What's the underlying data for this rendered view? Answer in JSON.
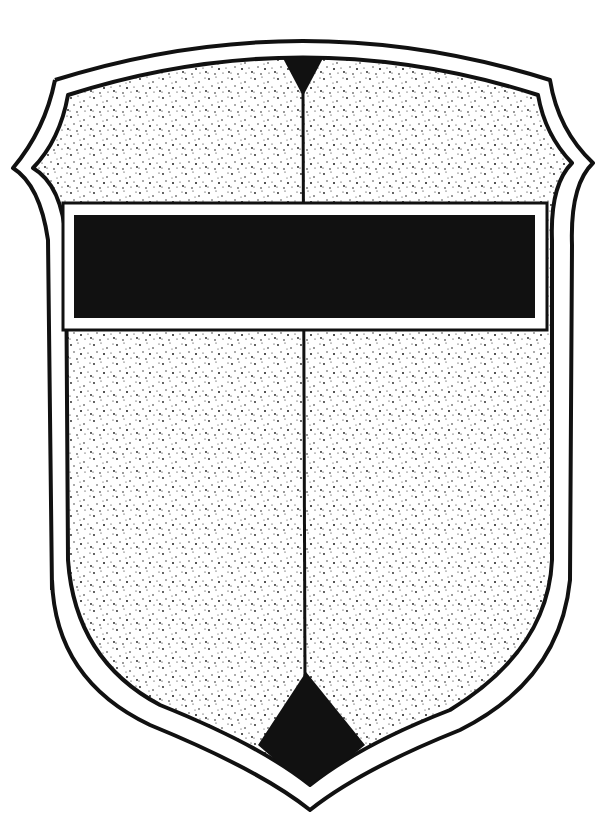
{
  "image": {
    "subject": "heraldic shield",
    "style": "black-and-white line drawing with stippled field",
    "colors": {
      "background": "#ffffff",
      "ink": "#111111",
      "field_dots": "#1a1a1a"
    }
  },
  "shield": {
    "outline": "double border with notched sides and pointed base",
    "field": "stippled (dotted) texture",
    "charges": [
      {
        "name": "fess",
        "description": "black horizontal bar with white border across upper third"
      },
      {
        "name": "pale-line",
        "description": "thin vertical line dividing the shield"
      },
      {
        "name": "chief-pile",
        "description": "black inverted triangle at top center"
      },
      {
        "name": "base-lozenge",
        "description": "black diamond point at bottom center"
      }
    ]
  }
}
